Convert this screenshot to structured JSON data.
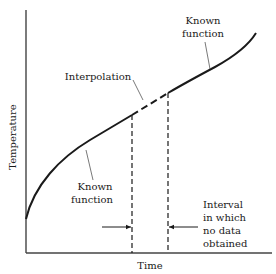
{
  "diagram": {
    "title": "",
    "axes": {
      "x_label": "Time",
      "y_label": "Temperature"
    },
    "annotations": {
      "interpolation": "Interpolation",
      "known_function_upper": [
        "Known",
        "function"
      ],
      "known_function_lower": [
        "Known",
        "function"
      ],
      "interval_note": [
        "Interval",
        "in which",
        "no data",
        "obtained"
      ]
    },
    "colors": {
      "line": "#1a1a1a",
      "background": "#ffffff"
    },
    "geometry": {
      "gap_start_x": 132,
      "gap_end_x": 168
    }
  }
}
